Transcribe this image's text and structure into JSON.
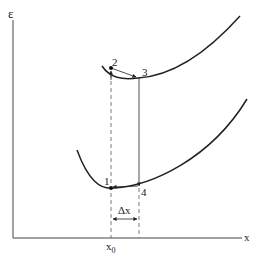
{
  "diagram": {
    "y_axis_label": "ε",
    "x_axis_label": "x",
    "x0_label_base": "x",
    "x0_label_sub": "0",
    "delta_label": "Δx",
    "points": [
      {
        "id": "1",
        "label": "1"
      },
      {
        "id": "2",
        "label": "2"
      },
      {
        "id": "3",
        "label": "3"
      },
      {
        "id": "4",
        "label": "4"
      }
    ],
    "curves": [
      {
        "name": "upper-curve",
        "description": "excited state potential"
      },
      {
        "name": "lower-curve",
        "description": "ground state potential"
      }
    ],
    "colors": {
      "line": "#222222",
      "dashed": "#555555",
      "axis": "#444444"
    }
  }
}
